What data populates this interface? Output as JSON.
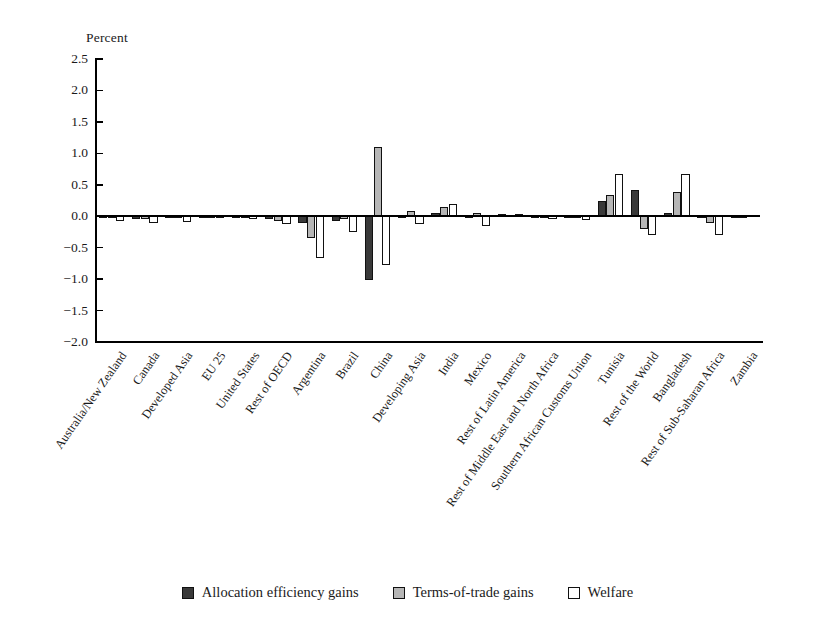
{
  "chart_data": {
    "type": "bar",
    "title": "",
    "ylabel": "Percent",
    "xlabel": "",
    "ylim": [
      -2.0,
      2.5
    ],
    "ytick_labels": [
      "2.5",
      "2.0",
      "1.5",
      "1.0",
      "0.5",
      "0.0",
      "−0.5",
      "−1.0",
      "−1.5",
      "−2.0"
    ],
    "ytick_values": [
      2.5,
      2.0,
      1.5,
      1.0,
      0.5,
      0.0,
      -0.5,
      -1.0,
      -1.5,
      -2.0
    ],
    "grid": false,
    "legend_position": "bottom",
    "categories": [
      "Australia/New Zealand",
      "Canada",
      "Developed Asia",
      "EU 25",
      "United States",
      "Rest of OECD",
      "Argentina",
      "Brazil",
      "China",
      "Developing Asia",
      "India",
      "Mexico",
      "Rest of Latin America",
      "Rest of Middle East and North Africa",
      "Southern African Customs Union",
      "Tunisia",
      "Rest of the World",
      "Bangladesh",
      "Rest of Sub-Saharan Africa",
      "Zambia"
    ],
    "series": [
      {
        "name": "Allocation efficiency gains",
        "color": "#393939",
        "values": [
          -0.02,
          -0.05,
          -0.02,
          -0.01,
          -0.02,
          -0.05,
          -0.1,
          -0.08,
          -1.02,
          0.01,
          0.05,
          0.01,
          0.03,
          0.01,
          -0.02,
          0.25,
          0.42,
          0.05,
          -0.03,
          0.01
        ]
      },
      {
        "name": "Terms-of-trade gains",
        "color": "#b6b6b6",
        "values": [
          -0.03,
          -0.04,
          -0.02,
          -0.01,
          -0.03,
          -0.08,
          -0.35,
          -0.05,
          1.1,
          0.08,
          0.15,
          0.05,
          0.02,
          -0.02,
          -0.03,
          0.33,
          -0.2,
          0.38,
          -0.1,
          0.01
        ]
      },
      {
        "name": "Welfare",
        "color": "#ffffff",
        "values": [
          -0.07,
          -0.1,
          -0.09,
          -0.02,
          -0.04,
          -0.12,
          -0.67,
          -0.25,
          -0.78,
          -0.12,
          0.2,
          -0.15,
          0.04,
          -0.04,
          -0.06,
          0.67,
          -0.3,
          0.67,
          -0.3,
          0.02
        ]
      }
    ]
  },
  "legend": {
    "items": [
      {
        "label": "Allocation efficiency gains",
        "key": "alloc"
      },
      {
        "label": "Terms-of-trade gains",
        "key": "tot"
      },
      {
        "label": "Welfare",
        "key": "wel"
      }
    ]
  }
}
